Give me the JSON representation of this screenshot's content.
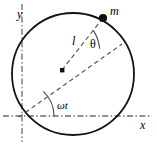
{
  "figure": {
    "type": "geometry-diagram",
    "width": 157,
    "height": 146,
    "background_color": "#ffffff",
    "stroke_color": "#1a1a1a",
    "dash_color": "#555555",
    "axes": {
      "y_label": "y",
      "x_label": "x",
      "y_axis_x": 22,
      "x_axis_y": 116,
      "style": "dash-dot"
    },
    "circle": {
      "center_x": 73,
      "center_y": 74,
      "radius": 61,
      "stroke_width": 1.7
    },
    "pivot": {
      "label": "",
      "x": 62,
      "y": 70,
      "shape": "filled-square",
      "size": 4
    },
    "mass": {
      "label": "m",
      "x": 103,
      "y": 18,
      "shape": "filled-circle",
      "radius": 4
    },
    "segments": [
      {
        "name": "length-l",
        "label": "l",
        "from_x": 62,
        "from_y": 70,
        "to_x": 103,
        "to_y": 18,
        "style": "dashed"
      },
      {
        "name": "reference-radius",
        "label": "",
        "from_x": 62,
        "from_y": 70,
        "to_x": 122,
        "to_y": 44,
        "style": "dashed"
      },
      {
        "name": "rotation-diagonal",
        "label": "",
        "from_x": 62,
        "from_y": 70,
        "to_x": 20,
        "to_y": 116,
        "style": "dashed"
      }
    ],
    "angles": [
      {
        "name": "theta",
        "label": "θ",
        "vertex_x": 62,
        "vertex_y": 70,
        "between": [
          "length-l",
          "reference-radius"
        ],
        "arc_radius": 40
      },
      {
        "name": "omega-t",
        "label": "ωt",
        "vertex_x": 20,
        "vertex_y": 116,
        "between": [
          "x-axis",
          "rotation-diagonal"
        ],
        "arc_radius": 34
      }
    ]
  }
}
